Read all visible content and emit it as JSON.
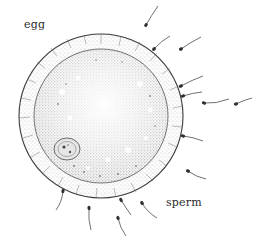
{
  "figure": {
    "labels": {
      "egg": "egg",
      "sperm": "sperm"
    },
    "colors": {
      "ink": "#2a2a2a",
      "membrane_stipple": "#6a6a6a",
      "cytoplasm_fill": "#d9d9d9",
      "background": "#ffffff"
    },
    "egg": {
      "center": [
        101,
        116
      ],
      "outer_radius": 82,
      "inner_radius": 67
    },
    "nucleus": {
      "center": [
        67,
        149
      ],
      "rx": 13,
      "ry": 11
    },
    "sperm": [
      {
        "head": [
          146,
          25
        ],
        "tail_end": [
          158,
          6
        ]
      },
      {
        "head": [
          154,
          49
        ],
        "tail_end": [
          170,
          36
        ]
      },
      {
        "head": [
          181,
          49
        ],
        "tail_end": [
          201,
          37
        ]
      },
      {
        "head": [
          181,
          86
        ],
        "tail_end": [
          203,
          76
        ]
      },
      {
        "head": [
          183,
          96
        ],
        "tail_end": [
          202,
          92
        ]
      },
      {
        "head": [
          204,
          103
        ],
        "tail_end": [
          229,
          99
        ]
      },
      {
        "head": [
          236,
          104
        ],
        "tail_end": [
          252,
          98
        ]
      },
      {
        "head": [
          183,
          136
        ],
        "tail_end": [
          203,
          141
        ]
      },
      {
        "head": [
          188,
          171
        ],
        "tail_end": [
          206,
          179
        ]
      },
      {
        "head": [
          142,
          203
        ],
        "tail_end": [
          157,
          218
        ]
      },
      {
        "head": [
          121,
          200
        ],
        "tail_end": [
          131,
          215
        ]
      },
      {
        "head": [
          118,
          218
        ],
        "tail_end": [
          126,
          236
        ]
      },
      {
        "head": [
          89,
          208
        ],
        "tail_end": [
          91,
          230
        ]
      },
      {
        "head": [
          63,
          191
        ],
        "tail_end": [
          56,
          210
        ]
      }
    ]
  }
}
